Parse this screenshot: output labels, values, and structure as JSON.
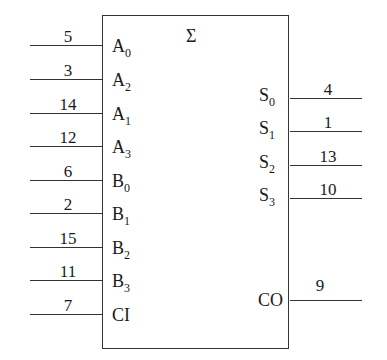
{
  "symbol": {
    "title": "Σ",
    "inputs": [
      {
        "pin": "5",
        "label": "A",
        "sub": "0"
      },
      {
        "pin": "3",
        "label": "A",
        "sub": "2"
      },
      {
        "pin": "14",
        "label": "A",
        "sub": "1"
      },
      {
        "pin": "12",
        "label": "A",
        "sub": "3"
      },
      {
        "pin": "6",
        "label": "B",
        "sub": "0"
      },
      {
        "pin": "2",
        "label": "B",
        "sub": "1"
      },
      {
        "pin": "15",
        "label": "B",
        "sub": "2"
      },
      {
        "pin": "11",
        "label": "B",
        "sub": "3"
      },
      {
        "pin": "7",
        "label": "CI",
        "sub": ""
      }
    ],
    "outputs": [
      {
        "pin": "4",
        "label": "S",
        "sub": "0"
      },
      {
        "pin": "1",
        "label": "S",
        "sub": "1"
      },
      {
        "pin": "13",
        "label": "S",
        "sub": "2"
      },
      {
        "pin": "10",
        "label": "S",
        "sub": "3"
      },
      {
        "pin": "9",
        "label": "CO",
        "sub": ""
      }
    ]
  }
}
